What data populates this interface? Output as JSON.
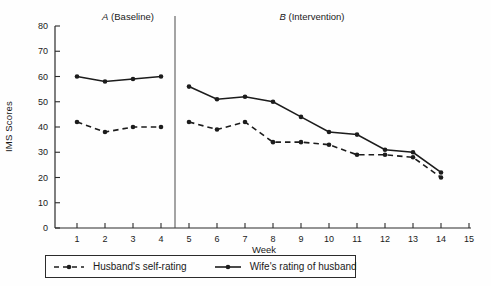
{
  "figure": {
    "ylabel": "IMS Scores",
    "xlabel": "Week",
    "phase_a_letter": "A",
    "phase_a_text": "(Baseline)",
    "phase_b_letter": "B",
    "phase_b_text": "(Intervention)"
  },
  "legend": {
    "husband_label": "Husband's self-rating",
    "wife_label": "Wife's rating of husband"
  },
  "colors": {
    "line": "#1c1c1c",
    "axis": "#2b2b2b",
    "divider": "#4a4a4a",
    "text": "#1a1a1a",
    "background": "#fefefe"
  },
  "chart_data": {
    "type": "line",
    "title": "",
    "xlabel": "Week",
    "ylabel": "IMS Scores",
    "x": [
      1,
      2,
      3,
      4,
      5,
      6,
      7,
      8,
      9,
      10,
      11,
      12,
      13,
      14
    ],
    "xticks": [
      1,
      2,
      3,
      4,
      5,
      6,
      7,
      8,
      9,
      10,
      11,
      12,
      13,
      14,
      15
    ],
    "xlim": [
      0.2,
      15.2
    ],
    "ylim": [
      0,
      80
    ],
    "ytick_step": 10,
    "grid": false,
    "legend_position": "bottom",
    "phase_divider_x": 4.5,
    "phases": [
      {
        "letter": "A",
        "label": "(Baseline)",
        "weeks": [
          1,
          4
        ]
      },
      {
        "letter": "B",
        "label": "(Intervention)",
        "weeks": [
          5,
          14
        ]
      }
    ],
    "series": [
      {
        "name": "Husband's self-rating",
        "style": "dashed",
        "marker": "circle",
        "color": "#1c1c1c",
        "values": [
          42,
          38,
          40,
          40,
          42,
          39,
          42,
          34,
          34,
          33,
          29,
          29,
          28,
          20
        ]
      },
      {
        "name": "Wife's rating of husband",
        "style": "solid",
        "marker": "circle",
        "color": "#1c1c1c",
        "values": [
          60,
          58,
          59,
          60,
          56,
          51,
          52,
          50,
          44,
          38,
          37,
          31,
          30,
          22
        ]
      }
    ]
  }
}
